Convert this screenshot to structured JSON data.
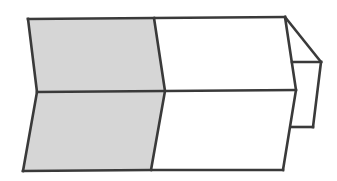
{
  "diagram": {
    "colors": {
      "background": "#ffffff",
      "stroke": "#3a3a3a",
      "shaded_face": "#d6d6d6"
    },
    "faces": [
      {
        "name": "shaded-upper-left",
        "fill": "shaded"
      },
      {
        "name": "shaded-lower-left",
        "fill": "shaded"
      },
      {
        "name": "white-upper-right",
        "fill": "white"
      },
      {
        "name": "white-lower-right",
        "fill": "white"
      },
      {
        "name": "end-flap-top",
        "fill": "white"
      },
      {
        "name": "end-flap-side",
        "fill": "white"
      }
    ]
  }
}
